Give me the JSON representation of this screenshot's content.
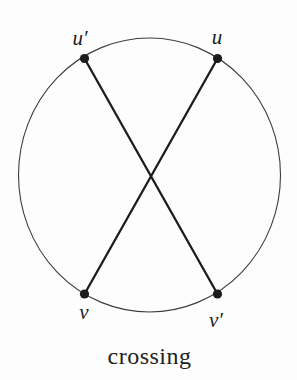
{
  "figure": {
    "caption": "crossing",
    "vertices": [
      {
        "label": "u′",
        "position": "top-left"
      },
      {
        "label": "u",
        "position": "top-right"
      },
      {
        "label": "v",
        "position": "bottom-left"
      },
      {
        "label": "v′",
        "position": "bottom-right"
      }
    ],
    "edges": [
      {
        "from": "u′",
        "to": "v′"
      },
      {
        "from": "u",
        "to": "v"
      }
    ],
    "colors": {
      "ink": "#1c1c1c",
      "circle_stroke": "#3d3d3d",
      "background": "#fdfdfd"
    }
  }
}
